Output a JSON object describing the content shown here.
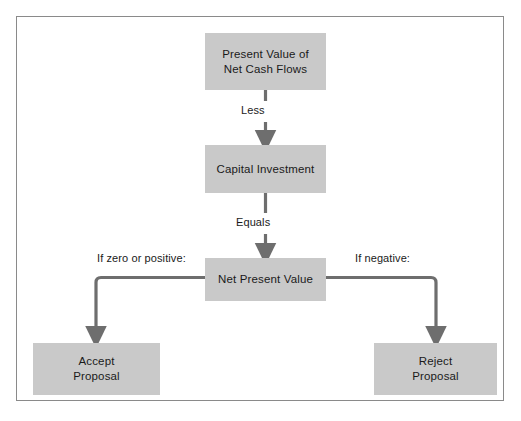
{
  "diagram": {
    "colors": {
      "node_fill": "#c9c9c9",
      "frame_border": "#8a8a8a",
      "connector": "#6e6e6e",
      "text": "#1a1a1a",
      "background": "#ffffff"
    },
    "nodes": [
      {
        "id": "present-value",
        "label": "Present Value of\nNet Cash Flows",
        "line1": "Present Value of",
        "line2": "Net Cash Flows"
      },
      {
        "id": "capital-investment",
        "label": "Capital Investment",
        "line1": "Capital Investment",
        "line2": ""
      },
      {
        "id": "net-present-value",
        "label": "Net Present Value",
        "line1": "Net Present Value",
        "line2": ""
      },
      {
        "id": "accept-proposal",
        "label": "Accept\nProposal",
        "line1": "Accept",
        "line2": "Proposal"
      },
      {
        "id": "reject-proposal",
        "label": "Reject\nProposal",
        "line1": "Reject",
        "line2": "Proposal"
      }
    ],
    "edges": [
      {
        "id": "pv-to-ci",
        "label": "Less",
        "from": "present-value",
        "to": "capital-investment"
      },
      {
        "id": "ci-to-npv",
        "label": "Equals",
        "from": "capital-investment",
        "to": "net-present-value"
      },
      {
        "id": "npv-to-accept",
        "label": "If zero or positive:",
        "from": "net-present-value",
        "to": "accept-proposal"
      },
      {
        "id": "npv-to-reject",
        "label": "If negative:",
        "from": "net-present-value",
        "to": "reject-proposal"
      }
    ]
  }
}
